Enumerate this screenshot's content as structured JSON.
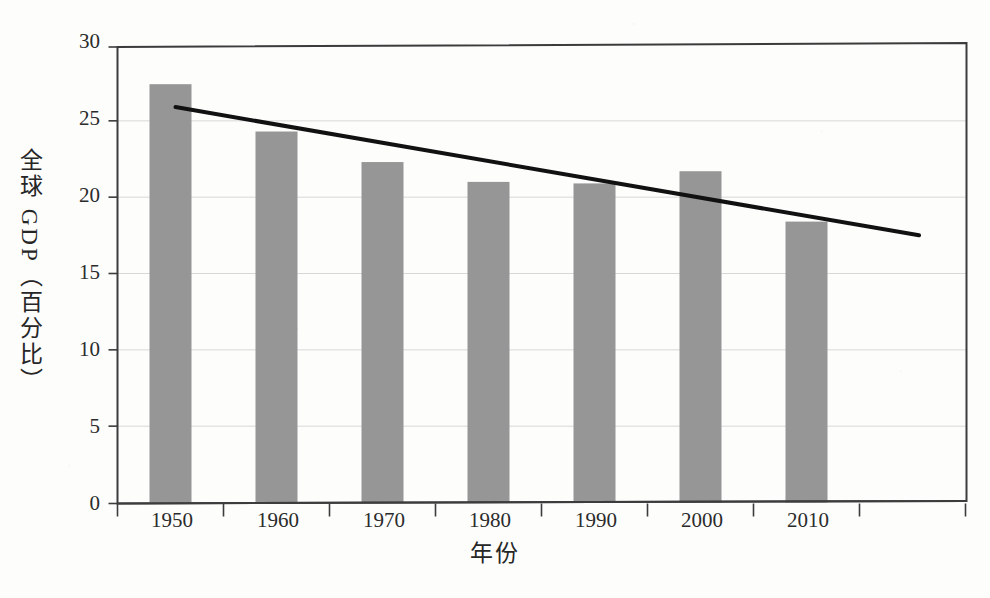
{
  "figure": {
    "background_color": "#fdfdfc",
    "plot_frame_color": "#3c3c3c",
    "gridline_color": "#d8d8d8",
    "bar_color": "#969696",
    "trendline_color": "#111111"
  },
  "chart_data": {
    "type": "bar",
    "title": "",
    "xlabel": "年份",
    "ylabel": "全球 GDP（百分比）",
    "categories": [
      "1950",
      "1960",
      "1970",
      "1980",
      "1990",
      "2000",
      "2010"
    ],
    "values": [
      27.4,
      24.3,
      22.3,
      21.0,
      20.9,
      21.7,
      18.4
    ],
    "series": [
      {
        "name": "全球 GDP（百分比）",
        "type": "bar",
        "values": [
          27.4,
          24.3,
          22.3,
          21.0,
          20.9,
          21.7,
          18.4
        ]
      },
      {
        "name": "趋势线",
        "type": "line",
        "x": [
          "1950",
          "2017"
        ],
        "values": [
          25.9,
          17.5
        ]
      }
    ],
    "ylim": [
      0,
      30
    ],
    "yticks": [
      0,
      5,
      10,
      15,
      20,
      25,
      30
    ],
    "ytick_labels": [
      "0",
      "5",
      "10",
      "15",
      "20",
      "25",
      "30"
    ],
    "xtick_labels": [
      "1950",
      "1960",
      "1970",
      "1980",
      "1990",
      "2000",
      "2010"
    ],
    "grid": true,
    "grid_axis": "y",
    "legend": false,
    "legend_position": "none",
    "annotations": []
  }
}
